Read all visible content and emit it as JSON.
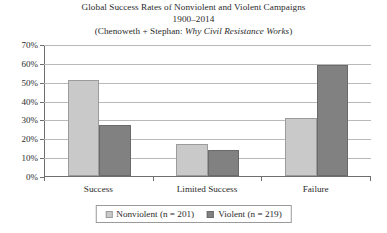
{
  "chart_data": {
    "type": "bar",
    "title": "Global Success Rates of Nonviolent and Violent Campaigns",
    "title_lines": [
      "Global Success Rates of Nonviolent and Violent Campaigns",
      "1900–2014"
    ],
    "source_line": {
      "prefix": "(Chenoweth + Stephan: ",
      "book_title": "Why Civil Resistance Works",
      "suffix": ")"
    },
    "categories": [
      "Success",
      "Limited Success",
      "Failure"
    ],
    "series": [
      {
        "name": "Nonviolent (n = 201)",
        "values": [
          51,
          17,
          31
        ],
        "color": "#c9c9c9"
      },
      {
        "name": "Violent (n = 219)",
        "values": [
          27,
          14,
          59
        ],
        "color": "#818181"
      }
    ],
    "xlabel": "",
    "ylabel": "",
    "ylim": [
      0,
      70
    ],
    "ytick_values": [
      70,
      60,
      50,
      40,
      30,
      20,
      10,
      0
    ],
    "ytick_labels": [
      "70%",
      "60%",
      "50%",
      "40%",
      "30%",
      "20%",
      "10%",
      "0%"
    ],
    "grid": true,
    "legend_position": "bottom"
  }
}
